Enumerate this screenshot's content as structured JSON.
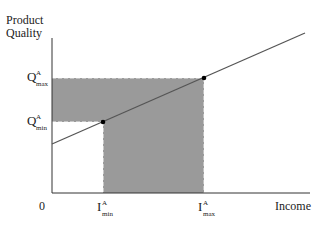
{
  "diagram": {
    "y_axis_label_line1": "Product",
    "y_axis_label_line2": "Quality",
    "x_axis_label": "Income",
    "origin_label": "0",
    "q_max": {
      "main": "Q",
      "sup": "A",
      "sub": "max"
    },
    "q_min": {
      "main": "Q",
      "sup": "A",
      "sub": "min"
    },
    "i_min": {
      "main": "I",
      "sup": "A",
      "sub": "min"
    },
    "i_max": {
      "main": "I",
      "sup": "A",
      "sub": "max"
    },
    "colors": {
      "axis": "#333333",
      "line": "#555555",
      "shade": "#9a9a9a",
      "dash": "#ffffff",
      "point": "#000000"
    }
  }
}
